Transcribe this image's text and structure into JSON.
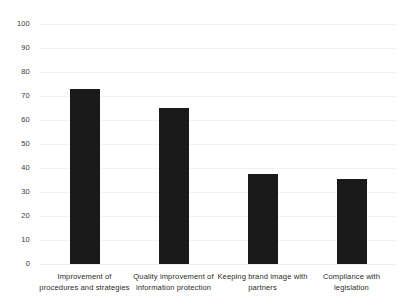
{
  "chart_data": {
    "type": "bar",
    "title": "",
    "subtitle": "",
    "xlabel": "",
    "ylabel": "",
    "categories": [
      "Improvement of procedures and strategies",
      "Quality improvement of information protection",
      "Keeping brand image with partners",
      "Compliance with legislation"
    ],
    "category_lines": [
      [
        "Improvement of",
        "procedures and strategies"
      ],
      [
        "Quality improvement of",
        "information protection"
      ],
      [
        "Keeping brand image with",
        "partners"
      ],
      [
        "Compliance with",
        "legislation"
      ]
    ],
    "values": [
      73,
      65,
      37.5,
      35.5
    ],
    "ylim": [
      0,
      100
    ],
    "yticks": [
      0,
      10,
      20,
      30,
      40,
      50,
      60,
      70,
      80,
      90,
      100
    ],
    "ytick_labels": [
      "0",
      "10",
      "20",
      "30",
      "40",
      "50",
      "60",
      "70",
      "80",
      "90",
      "100"
    ],
    "grid": true,
    "legend": null,
    "bar_color": "#1a1a1a",
    "gridline_color": "#f2f2f2",
    "background_color": "#ffffff"
  }
}
